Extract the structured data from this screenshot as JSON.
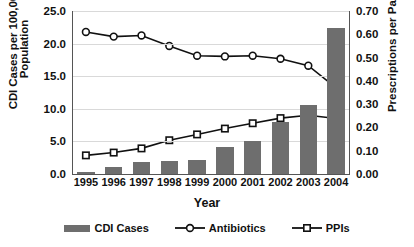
{
  "chart_data": {
    "type": "bar",
    "title": "",
    "xlabel": "Year",
    "ylabel": "CDI Cases per 100,000 Population",
    "ylabel_line1": "CDI Cases per 100,000",
    "ylabel_line2": "Population",
    "y2label": "Prescriptions per Patient",
    "categories": [
      "1995",
      "1996",
      "1997",
      "1998",
      "1999",
      "2000",
      "2001",
      "2002",
      "2003",
      "2004"
    ],
    "ylim": [
      0.0,
      25.0
    ],
    "yticks": [
      "0.0",
      "5.0",
      "10.0",
      "15.0",
      "20.0",
      "25.0"
    ],
    "ytick_values": [
      0.0,
      5.0,
      10.0,
      15.0,
      20.0,
      25.0
    ],
    "y2lim": [
      0.0,
      0.7
    ],
    "y2ticks": [
      "0.00",
      "0.10",
      "0.20",
      "0.30",
      "0.40",
      "0.50",
      "0.60",
      "0.70"
    ],
    "y2tick_values": [
      0.0,
      0.1,
      0.2,
      0.3,
      0.4,
      0.5,
      0.6,
      0.7
    ],
    "grid": true,
    "legend_position": "bottom",
    "series": [
      {
        "name": "CDI Cases",
        "type": "bar",
        "axis": "left",
        "color": "#6e6e6e",
        "values": [
          0.3,
          1.0,
          1.9,
          2.0,
          2.1,
          4.1,
          5.1,
          8.0,
          10.6,
          22.4
        ]
      },
      {
        "name": "Antibiotics",
        "type": "line",
        "marker": "circle",
        "axis": "right",
        "color": "#111111",
        "values": [
          0.61,
          0.59,
          0.595,
          0.55,
          0.508,
          0.505,
          0.508,
          0.495,
          0.465,
          0.37
        ]
      },
      {
        "name": "PPIs",
        "type": "line",
        "marker": "square",
        "axis": "right",
        "color": "#111111",
        "values": [
          0.08,
          0.092,
          0.11,
          0.145,
          0.17,
          0.195,
          0.218,
          0.24,
          0.252,
          0.238
        ]
      }
    ]
  },
  "legend": {
    "items": [
      {
        "label": "CDI Cases",
        "marker": "bar-swatch"
      },
      {
        "label": "Antibiotics",
        "marker": "circle-line-swatch"
      },
      {
        "label": "PPIs",
        "marker": "square-line-swatch"
      }
    ]
  }
}
